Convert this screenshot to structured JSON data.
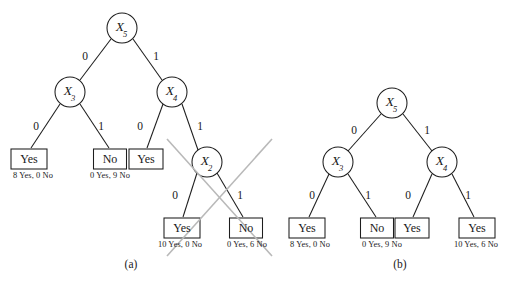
{
  "figure": {
    "background_color": "#ffffff",
    "ink_color": "#1d1d1d",
    "strike_color": "#b9b9b9",
    "panels": [
      {
        "id": "panel-a",
        "caption": "(a)",
        "caption_pos": {
          "x": 131,
          "y": 265
        },
        "has_pruning_strike": true,
        "strike_lines": [
          {
            "x1": 167,
            "y1": 139,
            "x2": 272,
            "y2": 256
          },
          {
            "x1": 272,
            "y1": 139,
            "x2": 167,
            "y2": 256
          }
        ],
        "nodes": [
          {
            "id": "a-x5",
            "shape": "circle",
            "label": "X",
            "subscript": "5",
            "x": 122,
            "y": 28,
            "r": 15
          },
          {
            "id": "a-x3",
            "shape": "circle",
            "label": "X",
            "subscript": "3",
            "x": 70,
            "y": 92,
            "r": 15
          },
          {
            "id": "a-x4",
            "shape": "circle",
            "label": "X",
            "subscript": "4",
            "x": 172,
            "y": 92,
            "r": 15
          },
          {
            "id": "a-x2",
            "shape": "circle",
            "label": "X",
            "subscript": "2",
            "x": 207,
            "y": 162,
            "r": 15
          }
        ],
        "leaves": [
          {
            "id": "a-leaf-1",
            "label": "Yes",
            "x": 29,
            "y": 159,
            "w": 36,
            "h": 20,
            "stat": "8 Yes, 0 No",
            "stat_x": 33,
            "stat_y": 176
          },
          {
            "id": "a-leaf-2",
            "label": "No",
            "x": 110,
            "y": 159,
            "w": 33,
            "h": 20,
            "stat": "0 Yes, 9 No",
            "stat_x": 110,
            "stat_y": 176
          },
          {
            "id": "a-leaf-3",
            "label": "Yes",
            "x": 146,
            "y": 159,
            "w": 34,
            "h": 20,
            "stat": "",
            "stat_x": 0,
            "stat_y": 0
          },
          {
            "id": "a-leaf-4",
            "label": "Yes",
            "x": 182,
            "y": 228,
            "w": 36,
            "h": 20,
            "stat": "10 Yes, 0 No",
            "stat_x": 180,
            "stat_y": 245
          },
          {
            "id": "a-leaf-5",
            "label": "No",
            "x": 246,
            "y": 228,
            "w": 33,
            "h": 20,
            "stat": "0 Yes, 6 No",
            "stat_x": 247,
            "stat_y": 245
          }
        ],
        "edges": [
          {
            "from": "a-x5",
            "to": "a-x3",
            "label": "0",
            "lx": 85,
            "ly": 57
          },
          {
            "from": "a-x5",
            "to": "a-x4",
            "label": "1",
            "lx": 156,
            "ly": 57
          },
          {
            "from": "a-x3",
            "to": "a-leaf-1",
            "label": "0",
            "lx": 36,
            "ly": 127
          },
          {
            "from": "a-x3",
            "to": "a-leaf-2",
            "label": "1",
            "lx": 101,
            "ly": 127
          },
          {
            "from": "a-x4",
            "to": "a-leaf-3",
            "label": "0",
            "lx": 140,
            "ly": 127
          },
          {
            "from": "a-x4",
            "to": "a-x2",
            "label": "1",
            "lx": 200,
            "ly": 127
          },
          {
            "from": "a-x2",
            "to": "a-leaf-4",
            "label": "0",
            "lx": 175,
            "ly": 196
          },
          {
            "from": "a-x2",
            "to": "a-leaf-5",
            "label": "1",
            "lx": 240,
            "ly": 196
          }
        ]
      },
      {
        "id": "panel-b",
        "caption": "(b)",
        "caption_pos": {
          "x": 400,
          "y": 265
        },
        "has_pruning_strike": false,
        "strike_lines": [],
        "nodes": [
          {
            "id": "b-x5",
            "shape": "circle",
            "label": "X",
            "subscript": "5",
            "x": 392,
            "y": 103,
            "r": 15
          },
          {
            "id": "b-x3",
            "shape": "circle",
            "label": "X",
            "subscript": "3",
            "x": 338,
            "y": 162,
            "r": 15
          },
          {
            "id": "b-x4",
            "shape": "circle",
            "label": "X",
            "subscript": "4",
            "x": 442,
            "y": 162,
            "r": 15
          },
          {
            "id": "b-leafbox",
            "shape": "none",
            "label": "",
            "subscript": "",
            "x": 0,
            "y": 0,
            "r": 0
          }
        ],
        "leaves": [
          {
            "id": "b-leaf-1",
            "label": "Yes",
            "x": 307,
            "y": 228,
            "w": 36,
            "h": 20,
            "stat": "8 Yes, 0 No",
            "stat_x": 310,
            "stat_y": 245
          },
          {
            "id": "b-leaf-2",
            "label": "No",
            "x": 377,
            "y": 228,
            "w": 33,
            "h": 20,
            "stat": "0 Yes, 9 No",
            "stat_x": 382,
            "stat_y": 245
          },
          {
            "id": "b-leaf-3",
            "label": "Yes",
            "x": 412,
            "y": 228,
            "w": 34,
            "h": 20,
            "stat": "",
            "stat_x": 0,
            "stat_y": 0
          },
          {
            "id": "b-leaf-4",
            "label": "Yes",
            "x": 477,
            "y": 228,
            "w": 36,
            "h": 20,
            "stat": "10 Yes, 6 No",
            "stat_x": 476,
            "stat_y": 245
          }
        ],
        "edges": [
          {
            "from": "b-x5",
            "to": "b-x3",
            "label": "0",
            "lx": 354,
            "ly": 131
          },
          {
            "from": "b-x5",
            "to": "b-x4",
            "label": "1",
            "lx": 427,
            "ly": 131
          },
          {
            "from": "b-x3",
            "to": "b-leaf-1",
            "label": "0",
            "lx": 312,
            "ly": 196
          },
          {
            "from": "b-x3",
            "to": "b-leaf-2",
            "label": "1",
            "lx": 368,
            "ly": 196
          },
          {
            "from": "b-x4",
            "to": "b-leaf-3",
            "label": "0",
            "lx": 408,
            "ly": 196
          },
          {
            "from": "b-x4",
            "to": "b-leaf-4",
            "label": "1",
            "lx": 468,
            "ly": 196
          }
        ]
      }
    ]
  }
}
